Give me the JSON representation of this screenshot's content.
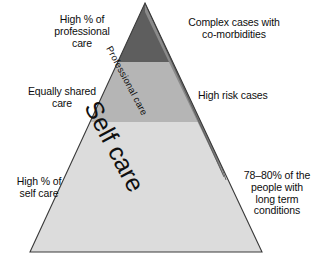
{
  "diagram": {
    "type": "pyramid",
    "tiers": [
      {
        "id": "tier-top",
        "level": 3,
        "fill": "#5e5e5e",
        "left_label": "High % of\nprofessional\ncare",
        "right_label": "Complex cases with\nco-morbidities"
      },
      {
        "id": "tier-middle",
        "level": 2,
        "fill": "#b5b5b5",
        "left_label": "Equally shared\ncare",
        "right_label": "High risk cases"
      },
      {
        "id": "tier-bottom",
        "level": 1,
        "fill": "#dcdcdc",
        "left_label": "High % of\nself care",
        "right_label": "78–80% of the\npeople with\nlong term\nconditions"
      }
    ],
    "bands": [
      {
        "id": "band-professional",
        "label": "Professional care",
        "fill": "#8a8a8a"
      },
      {
        "id": "band-self",
        "label": "Self care",
        "fill": "transparent"
      }
    ],
    "colors": {
      "tier_top": "#5e5e5e",
      "tier_middle": "#b5b5b5",
      "tier_bottom": "#dcdcdc",
      "band_professional": "#8a8a8a",
      "outline": "#3a3a3a",
      "text": "#0d0d0d",
      "background": "#ffffff"
    }
  }
}
